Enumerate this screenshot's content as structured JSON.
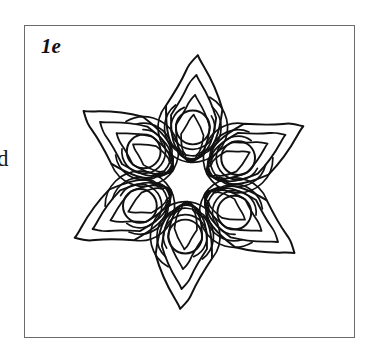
{
  "panel": {
    "label": "1e",
    "border_color": "#6b6b6b",
    "background_color": "#ffffff"
  },
  "edge_fragment": {
    "text": "d",
    "description": "clipped label of adjacent panel at left page margin"
  },
  "chart_data": {
    "type": "line",
    "title": "1e",
    "subtitle": "",
    "xlabel": "",
    "ylabel": "",
    "grid": false,
    "legend": null,
    "axis_visible": false,
    "tick_labels": [],
    "annotations": [
      "1e"
    ],
    "stroke_color": "#111111",
    "fill": "none",
    "symmetry_order": 6,
    "center": [
      189,
      196
    ],
    "contour_levels_per_petal": 4,
    "petal_angles_deg": [
      90,
      150,
      210,
      270,
      330,
      30
    ],
    "petal_tip_radius": 128,
    "inner_circle_radius": 17,
    "inner_circle_orbit_radius": 55,
    "series": [
      {
        "name": "contour-level-1",
        "radial_extent": 128,
        "stroke_width": 2.0
      },
      {
        "name": "contour-level-2",
        "radial_extent": 108,
        "stroke_width": 1.9
      },
      {
        "name": "contour-level-3",
        "radial_extent": 88,
        "stroke_width": 1.8
      },
      {
        "name": "contour-level-4",
        "radial_extent": 68,
        "stroke_width": 1.7
      },
      {
        "name": "fixed-point-circle",
        "radial_extent": 17,
        "stroke_width": 2.0
      }
    ],
    "petal_tips_px": [
      [
        189,
        60
      ],
      [
        299,
        125
      ],
      [
        300,
        297
      ],
      [
        148,
        327
      ],
      [
        40,
        210
      ],
      [
        88,
        66
      ]
    ]
  }
}
